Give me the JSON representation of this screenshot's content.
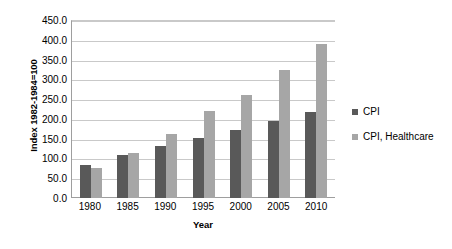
{
  "chart_data": {
    "type": "bar",
    "title": "",
    "subtitle": "",
    "xlabel": "Year",
    "ylabel": "Index 1982-1984=100",
    "categories": [
      "1980",
      "1985",
      "1990",
      "1995",
      "2000",
      "2005",
      "2010"
    ],
    "series": [
      {
        "name": "CPI",
        "color": "#595959",
        "values": [
          82.4,
          107.6,
          130.7,
          152.4,
          172.2,
          195.3,
          218.1
        ]
      },
      {
        "name": "CPI, Healthcare",
        "color": "#a6a6a6",
        "values": [
          74.9,
          113.5,
          162.8,
          220.5,
          260.8,
          323.2,
          388.4
        ]
      }
    ],
    "ylim": [
      0,
      450
    ],
    "ytick_step": 50,
    "ytick_labels": [
      "0.0",
      "50.0",
      "100.0",
      "150.0",
      "200.0",
      "250.0",
      "300.0",
      "350.0",
      "400.0",
      "450.0"
    ],
    "ytick_values": [
      0,
      50,
      100,
      150,
      200,
      250,
      300,
      350,
      400,
      450
    ],
    "grid": true,
    "grid_axis": "y",
    "legend_position": "right",
    "legend_entries": [
      "CPI",
      "CPI, Healthcare"
    ],
    "annotations": [],
    "background_color": "#ffffff",
    "gridline_color": "#c9c9c9",
    "axis_color": "#9e9e9e"
  }
}
